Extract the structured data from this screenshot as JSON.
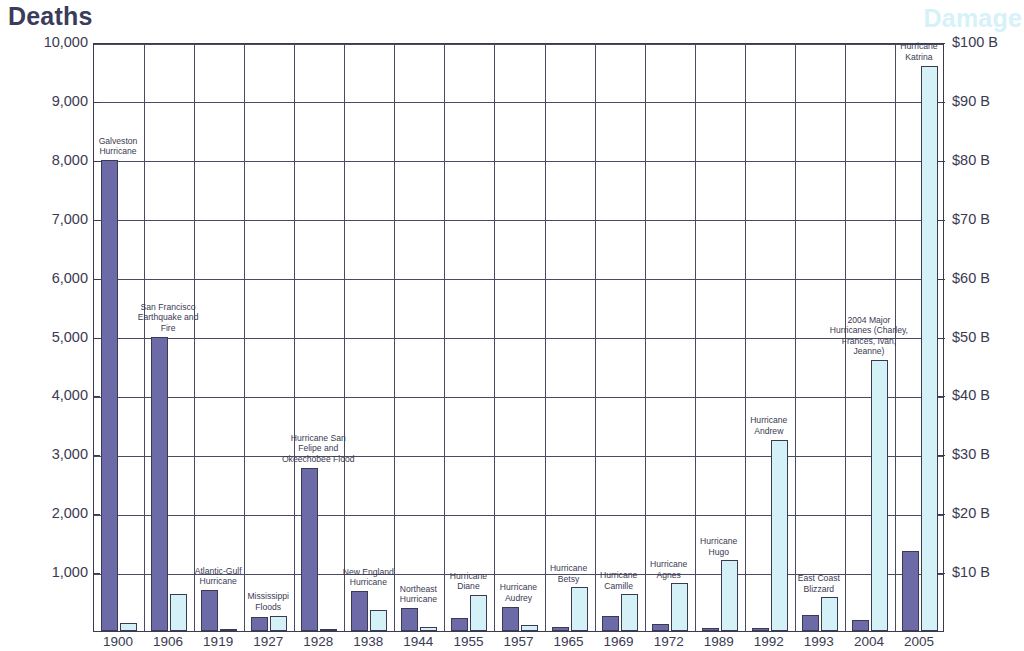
{
  "chart_title_left": "Deaths",
  "chart_title_right": "Damage",
  "chart_data": {
    "type": "bar",
    "title": "",
    "xlabel": "",
    "ylabel": "Deaths",
    "y2label": "Damage",
    "ylim": [
      0,
      10000
    ],
    "y2lim": [
      0,
      100
    ],
    "grid": true,
    "legend": "none",
    "categories": [
      "1900",
      "1906",
      "1919",
      "1927",
      "1928",
      "1938",
      "1944",
      "1955",
      "1957",
      "1965",
      "1969",
      "1972",
      "1989",
      "1992",
      "1993",
      "2004",
      "2005"
    ],
    "yticks": [
      "0",
      "1,000",
      "2,000",
      "3,000",
      "4,000",
      "5,000",
      "6,000",
      "7,000",
      "8,000",
      "9,000",
      "10,000"
    ],
    "y2ticks": [
      "$0",
      "$10 B",
      "$20 B",
      "$30 B",
      "$40 B",
      "$50 B",
      "$60 B",
      "$70 B",
      "$80 B",
      "$90 B",
      "$100 B"
    ],
    "series": [
      {
        "name": "Deaths",
        "color": "#6d6aa8",
        "values": [
          8000,
          5000,
          700,
          246,
          2775,
          682,
          390,
          218,
          416,
          75,
          256,
          122,
          56,
          53,
          270,
          185,
          1353
        ]
      },
      {
        "name": "Damage",
        "color": "#d5f1f8",
        "values": [
          1.3,
          6.2,
          0.3,
          2.6,
          0.4,
          3.6,
          0.7,
          6.1,
          1.0,
          7.4,
          6.2,
          8.1,
          12.0,
          32.5,
          5.7,
          46.0,
          96.0
        ]
      }
    ],
    "annotations": [
      {
        "index": 0,
        "label": "Galveston\nHurricane"
      },
      {
        "index": 1,
        "label": "San Francisco\nEarthquake and\nFire"
      },
      {
        "index": 2,
        "label": "Atlantic-Gulf\nHurricane"
      },
      {
        "index": 3,
        "label": "Mississippi\nFloods"
      },
      {
        "index": 4,
        "label": "Hurricane San\nFelipe and\nOkeechobee Flood"
      },
      {
        "index": 5,
        "label": "New England\nHurricane"
      },
      {
        "index": 6,
        "label": "Northeast\nHurricane"
      },
      {
        "index": 7,
        "label": "Hurricane\nDiane"
      },
      {
        "index": 8,
        "label": "Hurricane\nAudrey"
      },
      {
        "index": 9,
        "label": "Hurricane\nBetsy"
      },
      {
        "index": 10,
        "label": "Hurricane\nCamille"
      },
      {
        "index": 11,
        "label": "Hurricane\nAgnes"
      },
      {
        "index": 12,
        "label": "Hurricane\nHugo"
      },
      {
        "index": 13,
        "label": "Hurricane\nAndrew"
      },
      {
        "index": 14,
        "label": "East Coast\nBlizzard"
      },
      {
        "index": 15,
        "label": "2004 Major\nHurricanes (Charley,\nFrances, Ivan,\nJeanne)"
      },
      {
        "index": 16,
        "label": "Hurricane\nKatrina"
      }
    ]
  }
}
